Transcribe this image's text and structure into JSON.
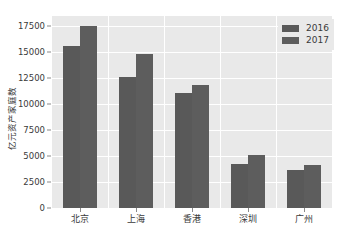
{
  "figure": {
    "clipped_header_left": "",
    "clipped_header_right": ""
  },
  "legend": {
    "position": "upper-right",
    "entries": [
      {
        "label": "2016",
        "color": "#595959"
      },
      {
        "label": "2017",
        "color": "#5d5d5d"
      }
    ]
  },
  "axes": {
    "y_label": "亿元资产家庭数",
    "y_ticks": [
      "0",
      "2500",
      "5000",
      "7500",
      "10000",
      "12500",
      "15000",
      "17500"
    ],
    "x_ticks": [
      "北京",
      "上海",
      "香港",
      "深圳",
      "广州"
    ]
  },
  "style": {
    "plot_background": "#e9e9e9",
    "grid_color": "#ffffff",
    "page_background": "#ffffff",
    "tick_color": "#3a3a3a"
  },
  "chart_data": {
    "type": "bar",
    "title": "",
    "xlabel": "",
    "ylabel": "亿元资产家庭数",
    "categories": [
      "北京",
      "上海",
      "香港",
      "深圳",
      "广州"
    ],
    "series": [
      {
        "name": "2016",
        "color": "#595959",
        "values": [
          15600,
          12600,
          11100,
          4200,
          3700
        ]
      },
      {
        "name": "2017",
        "color": "#5d5d5d",
        "values": [
          17500,
          14800,
          11900,
          5100,
          4100
        ]
      }
    ],
    "ylim": [
      0,
      18500
    ],
    "ytick_values": [
      0,
      2500,
      5000,
      7500,
      10000,
      12500,
      15000,
      17500
    ],
    "grid": true,
    "grid_axis": "both",
    "legend_position": "upper right"
  }
}
